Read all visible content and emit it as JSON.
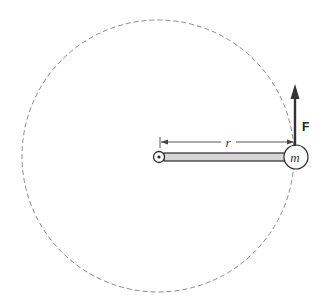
{
  "diagram": {
    "labels": {
      "force": "F",
      "radius": "r",
      "mass": "m"
    },
    "colors": {
      "orbit": "#8a8a8a",
      "rod_fill": "#d6d6d6",
      "stroke": "#2a2a2a",
      "arrow": "#333333"
    },
    "geometry": {
      "orbit_center": [
        158,
        156
      ],
      "orbit_radius": 136,
      "pivot": [
        159,
        157
      ],
      "mass_center": [
        296,
        157
      ],
      "mass_radius": 12,
      "force_arrow_from": [
        295,
        146
      ],
      "force_arrow_to": [
        295,
        84
      ]
    }
  }
}
